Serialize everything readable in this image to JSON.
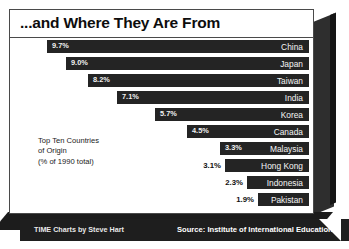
{
  "title": "...and Where They Are From",
  "caption_lines": "Top Ten Countries\nof Origin\n(% of 1990 total)",
  "footer": {
    "credit": "TIME Charts by Steve Hart",
    "source": "Source: Institute of International Education"
  },
  "colors": {
    "bar": "#242424",
    "panel_bg": "#ffffff",
    "frame": "#4a4a4a",
    "footer_bg": "#1e1e1e",
    "value_inside": "#f2f2f2",
    "value_outside": "#111111",
    "country_label": "#f5f5f5"
  },
  "chart_data": {
    "type": "bar",
    "orientation": "horizontal",
    "title": "...and Where They Are From",
    "subtitle": "Top Ten Countries of Origin (% of 1990 total)",
    "xlabel": "",
    "ylabel": "",
    "unit": "%",
    "source": "Institute of International Education",
    "credit": "TIME Charts by Steve Hart",
    "grid": false,
    "legend": "none",
    "xlim": [
      0,
      9.7
    ],
    "categories": [
      "China",
      "Japan",
      "Taiwan",
      "India",
      "Korea",
      "Canada",
      "Malaysia",
      "Hong Kong",
      "Indonesia",
      "Pakistan"
    ],
    "values": [
      9.7,
      9.0,
      8.2,
      7.1,
      5.7,
      4.5,
      3.3,
      3.1,
      2.3,
      1.9
    ],
    "value_labels": [
      "9.7%",
      "9.0%",
      "8.2%",
      "7.1%",
      "5.7%",
      "4.5%",
      "3.3%",
      "3.1%",
      "2.3%",
      "1.9%"
    ],
    "bars": [
      {
        "country": "China",
        "value": 9.7,
        "label": "9.7%",
        "label_position": "inside"
      },
      {
        "country": "Japan",
        "value": 9.0,
        "label": "9.0%",
        "label_position": "inside"
      },
      {
        "country": "Taiwan",
        "value": 8.2,
        "label": "8.2%",
        "label_position": "inside"
      },
      {
        "country": "India",
        "value": 7.1,
        "label": "7.1%",
        "label_position": "inside"
      },
      {
        "country": "Korea",
        "value": 5.7,
        "label": "5.7%",
        "label_position": "inside"
      },
      {
        "country": "Canada",
        "value": 4.5,
        "label": "4.5%",
        "label_position": "inside"
      },
      {
        "country": "Malaysia",
        "value": 3.3,
        "label": "3.3%",
        "label_position": "inside"
      },
      {
        "country": "Hong Kong",
        "value": 3.1,
        "label": "3.1%",
        "label_position": "outside"
      },
      {
        "country": "Indonesia",
        "value": 2.3,
        "label": "2.3%",
        "label_position": "outside"
      },
      {
        "country": "Pakistan",
        "value": 1.9,
        "label": "1.9%",
        "label_position": "outside"
      }
    ]
  }
}
